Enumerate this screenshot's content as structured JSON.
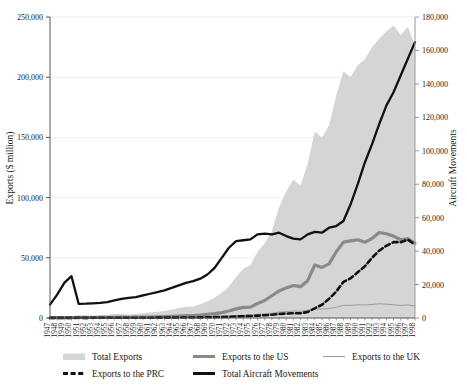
{
  "chart_data": {
    "type": "area",
    "title": "",
    "xlabel": "",
    "ylabel": "Exports ($ million)",
    "y2label": "Aircraft Movements",
    "grid": true,
    "legend_position": "bottom",
    "ylim": [
      0,
      250000
    ],
    "y2lim": [
      0,
      180000
    ],
    "yticks": [
      "0",
      "50,000",
      "100,000",
      "150,000",
      "200,000",
      "250,000"
    ],
    "ytick_values": [
      0,
      50000,
      100000,
      150000,
      200000,
      250000
    ],
    "y2ticks": [
      "0",
      "20,000",
      "40,000",
      "60,000",
      "80,000",
      "100,000",
      "120,000",
      "140,000",
      "160,000",
      "180,000"
    ],
    "y2tick_values": [
      0,
      20000,
      40000,
      60000,
      80000,
      100000,
      120000,
      140000,
      160000,
      180000
    ],
    "x": [
      1947,
      1948,
      1949,
      1950,
      1951,
      1952,
      1953,
      1954,
      1955,
      1956,
      1957,
      1958,
      1959,
      1960,
      1961,
      1962,
      1963,
      1964,
      1965,
      1966,
      1967,
      1968,
      1969,
      1970,
      1971,
      1972,
      1973,
      1974,
      1975,
      1976,
      1977,
      1978,
      1979,
      1980,
      1981,
      1982,
      1983,
      1984,
      1985,
      1986,
      1987,
      1988,
      1989,
      1990,
      1991,
      1992,
      1993,
      1994,
      1995,
      1996,
      1997,
      1998
    ],
    "xticks": [
      "1947",
      "1948",
      "1949",
      "1950",
      "1951",
      "1952",
      "1953",
      "1954",
      "1955",
      "1956",
      "1957",
      "1958",
      "1959",
      "1960",
      "1961",
      "1962",
      "1963",
      "1964",
      "1965",
      "1966",
      "1967",
      "1968",
      "1969",
      "1970",
      "1971",
      "1972",
      "1973",
      "1974",
      "1975",
      "1976",
      "1977",
      "1978",
      "1979",
      "1980",
      "1981",
      "1982",
      "1983",
      "1984",
      "1985",
      "1986",
      "1987",
      "1988",
      "1989",
      "1990",
      "1991",
      "1992",
      "1993",
      "1994",
      "1995",
      "1996",
      "1997",
      "1998"
    ],
    "series": [
      {
        "name": "Total Exports",
        "type": "area",
        "axis": "left",
        "color": "#d5d5d5",
        "values": [
          900,
          1100,
          1300,
          1600,
          2400,
          2200,
          2100,
          2300,
          2700,
          3300,
          3400,
          3000,
          3300,
          4000,
          4500,
          5100,
          5900,
          7100,
          8300,
          9300,
          9500,
          11500,
          14000,
          17000,
          21000,
          26000,
          34000,
          41000,
          44000,
          55000,
          62000,
          72000,
          92000,
          105000,
          115000,
          110000,
          128000,
          155000,
          150000,
          160000,
          185000,
          205000,
          200000,
          210000,
          215000,
          225000,
          232000,
          238000,
          243000,
          235000,
          242000,
          226000
        ]
      },
      {
        "name": "Exports to the US",
        "type": "line",
        "axis": "left",
        "color": "#8a8a8a",
        "values": [
          200,
          250,
          300,
          350,
          400,
          380,
          400,
          450,
          500,
          600,
          650,
          600,
          650,
          750,
          850,
          950,
          1100,
          1300,
          1600,
          1900,
          2000,
          2400,
          3000,
          3600,
          4500,
          5800,
          7600,
          8800,
          9000,
          12000,
          14500,
          18500,
          22500,
          25000,
          27000,
          26000,
          31000,
          44000,
          42000,
          45000,
          55000,
          63000,
          64000,
          65000,
          63000,
          66000,
          71000,
          70000,
          68000,
          65000,
          66000,
          62000
        ]
      },
      {
        "name": "Exports to the UK",
        "type": "line",
        "axis": "left",
        "color": "#9a9a9a",
        "values": [
          120,
          150,
          160,
          180,
          200,
          190,
          200,
          210,
          240,
          280,
          300,
          280,
          300,
          330,
          360,
          400,
          450,
          520,
          600,
          680,
          700,
          800,
          950,
          1100,
          1350,
          1600,
          2000,
          2300,
          2400,
          3000,
          3400,
          4000,
          4800,
          5400,
          5800,
          5600,
          6400,
          7600,
          7400,
          7800,
          9000,
          10500,
          10500,
          11000,
          10800,
          11200,
          11800,
          11500,
          11000,
          10500,
          10800,
          10000
        ]
      },
      {
        "name": "Exports to the PRC",
        "type": "line-dashed",
        "axis": "left",
        "color": "#111111",
        "values": [
          100,
          120,
          130,
          140,
          150,
          140,
          150,
          160,
          170,
          200,
          210,
          200,
          210,
          230,
          250,
          280,
          300,
          340,
          380,
          420,
          440,
          500,
          600,
          700,
          850,
          1000,
          1300,
          1500,
          1600,
          2000,
          2300,
          2700,
          3300,
          3700,
          4000,
          3900,
          5000,
          8000,
          11000,
          16000,
          22000,
          30000,
          33000,
          38000,
          43000,
          50000,
          56000,
          60000,
          63000,
          63000,
          65000,
          61000
        ]
      },
      {
        "name": "Total Aircraft Movements",
        "type": "line",
        "axis": "right",
        "color": "#111111",
        "values": [
          8000,
          14000,
          21000,
          25000,
          8500,
          8600,
          8800,
          9000,
          9500,
          10500,
          11500,
          12000,
          12500,
          13500,
          14500,
          15500,
          16500,
          18000,
          19500,
          21000,
          22000,
          23500,
          26000,
          30000,
          36000,
          42000,
          46000,
          46500,
          47000,
          50000,
          50500,
          50000,
          51000,
          49000,
          47500,
          47000,
          50000,
          51500,
          51000,
          54000,
          55000,
          58000,
          68000,
          80000,
          93000,
          104000,
          116000,
          127000,
          135000,
          145000,
          155000,
          165000
        ]
      }
    ],
    "legend": [
      {
        "label": "Total Exports",
        "style": "swatch",
        "color": "#d5d5d5"
      },
      {
        "label": "Exports to the US",
        "style": "thick-line",
        "color": "#8a8a8a"
      },
      {
        "label": "Exports to the UK",
        "style": "thin-line",
        "color": "#9a9a9a"
      },
      {
        "label": "Exports to the PRC",
        "style": "dashed-line",
        "color": "#111111"
      },
      {
        "label": "Total Aircraft Movements",
        "style": "thick-line",
        "color": "#111111"
      }
    ]
  }
}
